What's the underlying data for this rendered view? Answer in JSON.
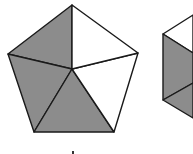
{
  "figure": {
    "width": 193,
    "height": 154,
    "colors": {
      "shaded": "#8c8c8c",
      "unshaded": "#ffffff",
      "stroke": "#1a1a1a"
    },
    "pentagon": {
      "vertices": {
        "top": [
          72,
          5
        ],
        "right": [
          138,
          53
        ],
        "bottom_right": [
          114,
          132
        ],
        "bottom_left": [
          34,
          132
        ],
        "left": [
          8,
          54
        ],
        "center": [
          72,
          69
        ]
      },
      "triangles": [
        {
          "name": "top-left",
          "points": "72,5 8,54 72,69",
          "shaded": true
        },
        {
          "name": "left-bottom",
          "points": "8,54 34,132 72,69",
          "shaded": true
        },
        {
          "name": "bottom",
          "points": "34,132 114,132 72,69",
          "shaded": true
        },
        {
          "name": "right-bottom",
          "points": "114,132 138,53 72,69",
          "shaded": false
        },
        {
          "name": "top-right",
          "points": "138,53 72,5 72,69",
          "shaded": false
        }
      ]
    },
    "second_shape": {
      "partially_visible": true,
      "regions": [
        {
          "name": "upper-left-white",
          "points": "163,34 193,15 193,53",
          "shaded": false
        },
        {
          "name": "middle-shaded",
          "points": "163,34 193,53 193,83 163,100",
          "shaded": true
        },
        {
          "name": "bottom-shaded",
          "points": "163,100 193,83 193,118",
          "shaded": true
        }
      ]
    },
    "label_mark": {
      "x": 73,
      "y": 152
    }
  }
}
